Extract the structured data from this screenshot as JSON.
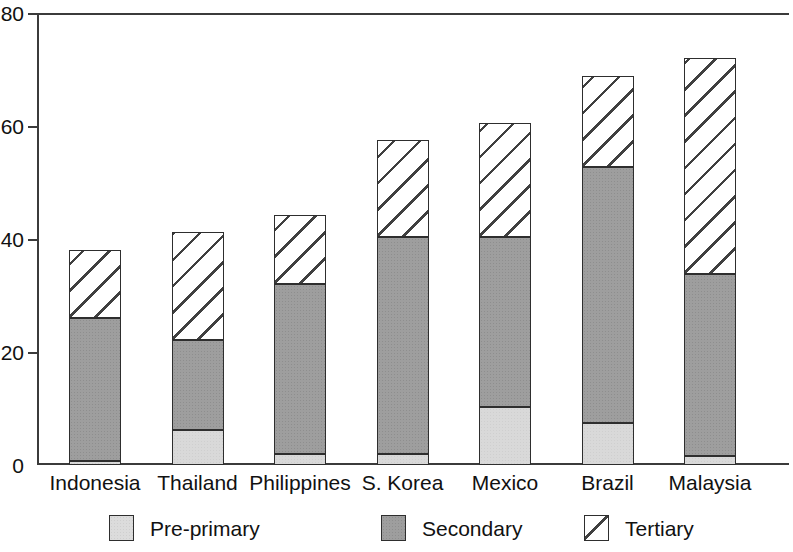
{
  "chart_data": {
    "type": "bar",
    "subtype": "stacked-vertical",
    "title": "",
    "subtitle": "",
    "xlabel": "",
    "ylabel": "",
    "ylim": [
      0,
      80
    ],
    "yticks": [
      0,
      20,
      40,
      60,
      80
    ],
    "ytick_labels": [
      "0",
      "20",
      "40",
      "60",
      "80"
    ],
    "grid": false,
    "legend_position": "bottom",
    "categories": [
      "Indonesia",
      "Thailand",
      "Philippines",
      "S. Korea",
      "Mexico",
      "Brazil",
      "Malaysia"
    ],
    "series": [
      {
        "name": "Pre-primary",
        "color": "#d9d9d9",
        "pattern": "light-stipple",
        "values": [
          0.7,
          6.2,
          2.0,
          2.0,
          10.3,
          7.4,
          1.6
        ]
      },
      {
        "name": "Secondary",
        "color": "#9e9e9e",
        "pattern": "dark-stipple",
        "values": [
          25.3,
          16.0,
          30.0,
          38.4,
          30.1,
          45.4,
          32.2
        ]
      },
      {
        "name": "Tertiary",
        "color": "#ffffff",
        "pattern": "diagonal-hatch",
        "values": [
          12.0,
          19.0,
          12.3,
          17.1,
          20.2,
          16.0,
          38.2
        ]
      }
    ],
    "totals": [
      38.0,
      41.2,
      44.3,
      57.5,
      60.6,
      68.8,
      72.0
    ]
  },
  "axis": {
    "y_tick_labels": [
      "80",
      "60",
      "40",
      "20",
      "0"
    ]
  },
  "legend": {
    "items": [
      {
        "label": "Pre-primary",
        "swatch": "pre"
      },
      {
        "label": "Secondary",
        "swatch": "sec"
      },
      {
        "label": "Tertiary",
        "swatch": "ter"
      }
    ]
  }
}
